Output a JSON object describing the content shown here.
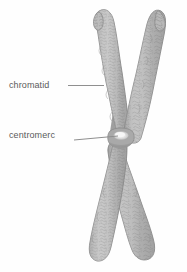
{
  "diagram": {
    "background_color": "#fefefe",
    "labels": [
      {
        "id": "chromatid",
        "text": "chromatid",
        "color": "#5b5b5b",
        "points_to": "upper-left chromatid arm"
      },
      {
        "id": "centromere",
        "text": "centromerc",
        "color": "#5b5b5b",
        "points_to": "centromere constriction"
      }
    ],
    "leader_lines": [
      {
        "id": "chromatid-leader",
        "color": "#8f8f8f"
      },
      {
        "id": "centromere-leader",
        "color": "#8f8f8f"
      }
    ],
    "chromosome": {
      "fill_color": "#b6b6b6",
      "outline_color": "#8a8a8a",
      "texture_color": "#9a9a9a",
      "shadow_color": "#8d8d8d",
      "centromere_highlight_color": "#efefef",
      "arms": [
        {
          "id": "upper-left-arm",
          "label": "chromatid"
        },
        {
          "id": "upper-right-arm",
          "label": "chromatid"
        },
        {
          "id": "lower-left-arm",
          "label": "chromatid"
        },
        {
          "id": "lower-right-arm",
          "label": "chromatid"
        }
      ]
    }
  }
}
